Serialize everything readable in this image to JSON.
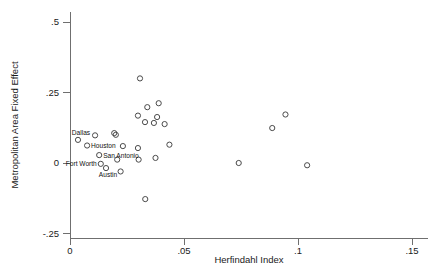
{
  "chart_data": {
    "type": "scatter",
    "title": "",
    "xlabel": "Herfindahl Index",
    "ylabel": "Metropolitan Area Fixed Effect",
    "xlim": [
      0,
      0.15
    ],
    "ylim": [
      -0.25,
      0.5
    ],
    "grid": false,
    "legend": "none",
    "xticks": [
      "0",
      ".05",
      ".1",
      ".15"
    ],
    "xtick_values": [
      0,
      0.05,
      0.1,
      0.15
    ],
    "yticks": [
      ".5",
      ".25",
      "0",
      "-.25"
    ],
    "ytick_values": [
      0.5,
      0.25,
      0,
      -0.25
    ],
    "marker": "open-circle",
    "points": [
      {
        "x": 0.0035,
        "y": 0.082,
        "label": "Dallas",
        "label_pos": "left-above"
      },
      {
        "x": 0.0075,
        "y": 0.062,
        "label": "Houston",
        "label_pos": "right"
      },
      {
        "x": 0.0128,
        "y": 0.028,
        "label": "San Antonio",
        "label_pos": "right"
      },
      {
        "x": 0.0135,
        "y": -0.003,
        "label": "Fort Worth",
        "label_pos": "left"
      },
      {
        "x": 0.0158,
        "y": -0.018,
        "label": "Austin",
        "label_pos": "right-below"
      },
      {
        "x": 0.011,
        "y": 0.098,
        "label": "",
        "label_pos": ""
      },
      {
        "x": 0.0194,
        "y": 0.106,
        "label": "",
        "label_pos": ""
      },
      {
        "x": 0.0201,
        "y": 0.1,
        "label": "",
        "label_pos": ""
      },
      {
        "x": 0.0232,
        "y": 0.06,
        "label": "",
        "label_pos": ""
      },
      {
        "x": 0.0207,
        "y": 0.012,
        "label": "",
        "label_pos": ""
      },
      {
        "x": 0.0222,
        "y": -0.03,
        "label": "",
        "label_pos": ""
      },
      {
        "x": 0.0307,
        "y": 0.3,
        "label": "",
        "label_pos": ""
      },
      {
        "x": 0.0298,
        "y": 0.168,
        "label": "",
        "label_pos": ""
      },
      {
        "x": 0.0339,
        "y": 0.198,
        "label": "",
        "label_pos": ""
      },
      {
        "x": 0.0329,
        "y": 0.145,
        "label": "",
        "label_pos": ""
      },
      {
        "x": 0.0368,
        "y": 0.142,
        "label": "",
        "label_pos": ""
      },
      {
        "x": 0.0382,
        "y": 0.163,
        "label": "",
        "label_pos": ""
      },
      {
        "x": 0.0389,
        "y": 0.212,
        "label": "",
        "label_pos": ""
      },
      {
        "x": 0.0415,
        "y": 0.138,
        "label": "",
        "label_pos": ""
      },
      {
        "x": 0.0298,
        "y": 0.053,
        "label": "",
        "label_pos": ""
      },
      {
        "x": 0.0301,
        "y": 0.012,
        "label": "",
        "label_pos": ""
      },
      {
        "x": 0.0375,
        "y": 0.018,
        "label": "",
        "label_pos": ""
      },
      {
        "x": 0.0436,
        "y": 0.065,
        "label": "",
        "label_pos": ""
      },
      {
        "x": 0.033,
        "y": -0.128,
        "label": "",
        "label_pos": ""
      },
      {
        "x": 0.074,
        "y": 0.0,
        "label": "",
        "label_pos": ""
      },
      {
        "x": 0.0887,
        "y": 0.124,
        "label": "",
        "label_pos": ""
      },
      {
        "x": 0.0945,
        "y": 0.172,
        "label": "",
        "label_pos": ""
      },
      {
        "x": 0.104,
        "y": -0.008,
        "label": "",
        "label_pos": ""
      }
    ]
  },
  "axes": {
    "x_title": "Herfindahl Index",
    "y_title": "Metropolitan Area Fixed Effect"
  }
}
